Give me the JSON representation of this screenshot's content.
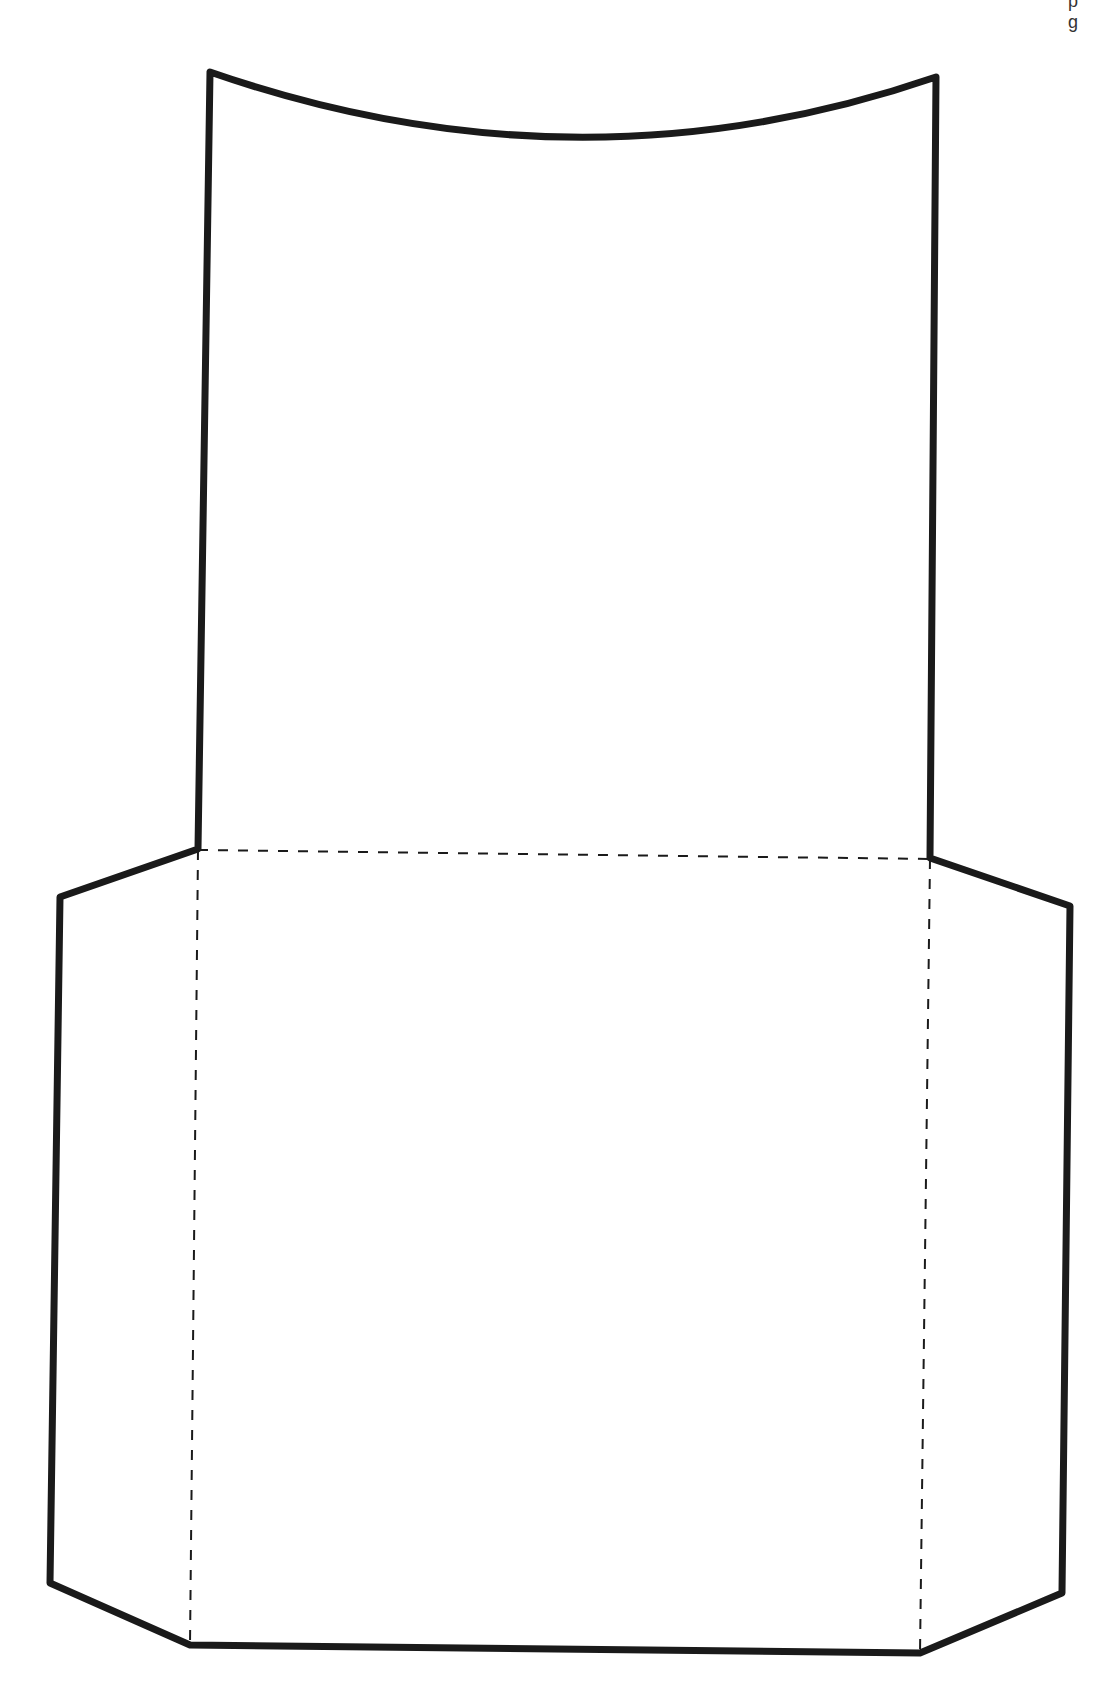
{
  "diagram": {
    "type": "papercraft-template",
    "corner_fragment": "p g",
    "colors": {
      "stroke": "#1a1a1a",
      "fold": "#1a1a1a",
      "background": "#ffffff"
    },
    "cut_line": {
      "style": "solid",
      "width": 7,
      "points": [
        [
          210,
          72
        ],
        [
          198,
          849
        ],
        [
          60,
          897
        ],
        [
          50,
          1583
        ],
        [
          190,
          1645
        ],
        [
          920,
          1653
        ],
        [
          1062,
          1593
        ],
        [
          1070,
          906
        ],
        [
          930,
          858
        ],
        [
          936,
          77
        ]
      ],
      "top_curve": {
        "from": [
          936,
          77
        ],
        "control": [
          578,
          200
        ],
        "to": [
          210,
          72
        ]
      }
    },
    "fold_lines": [
      {
        "name": "fold-top",
        "from": [
          198,
          850
        ],
        "to": [
          930,
          859
        ]
      },
      {
        "name": "fold-left",
        "from": [
          198,
          850
        ],
        "to": [
          190,
          1645
        ]
      },
      {
        "name": "fold-right",
        "from": [
          930,
          859
        ],
        "to": [
          920,
          1653
        ]
      }
    ]
  }
}
